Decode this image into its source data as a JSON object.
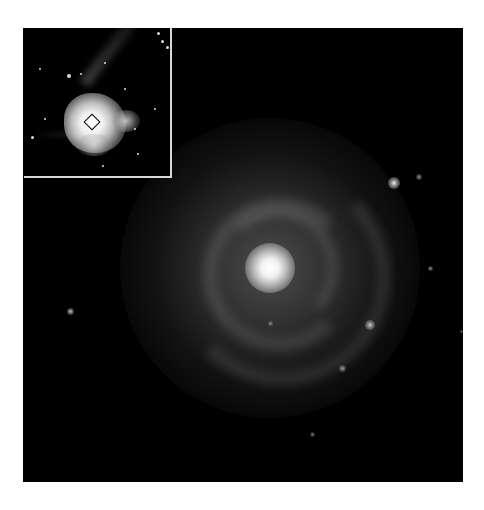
{
  "figure": {
    "colors": {
      "background": "#000000",
      "page": "#ffffff",
      "inset_border": "#d8d8d8"
    },
    "main_image": {
      "subject": "spiral-galaxy",
      "core_position": [
        270,
        268
      ]
    },
    "inset": {
      "subject": "bright-galaxy-with-jet",
      "marker": "square-region"
    }
  }
}
